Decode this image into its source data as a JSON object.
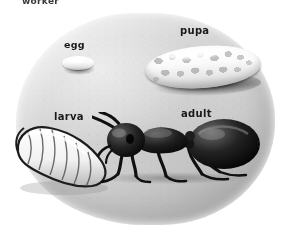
{
  "figure": {
    "medium": "grayscale illustration",
    "background_label": "soil-mound"
  },
  "top_caption": "worker",
  "labels": {
    "egg": "egg",
    "pupa": "pupa",
    "larva": "larva",
    "adult": "adult"
  },
  "stages": [
    {
      "name": "egg",
      "label": "egg",
      "shape": "small white oval with dark shadow"
    },
    {
      "name": "pupa",
      "label": "pupa",
      "shape": "large mottled cocoon"
    },
    {
      "name": "larva",
      "label": "larva",
      "shape": "segmented C-shaped grub"
    },
    {
      "name": "adult",
      "label": "adult",
      "shape": "black ant facing left"
    }
  ],
  "colors": {
    "background": "#ffffff",
    "mound": "#d4d4d4",
    "mound_shadow": "#a8a8a8",
    "specimen_light": "#ffffff",
    "specimen_shade": "#c4c4c4",
    "ant_body": "#1a1a1a",
    "text": "#1a1a1a"
  }
}
